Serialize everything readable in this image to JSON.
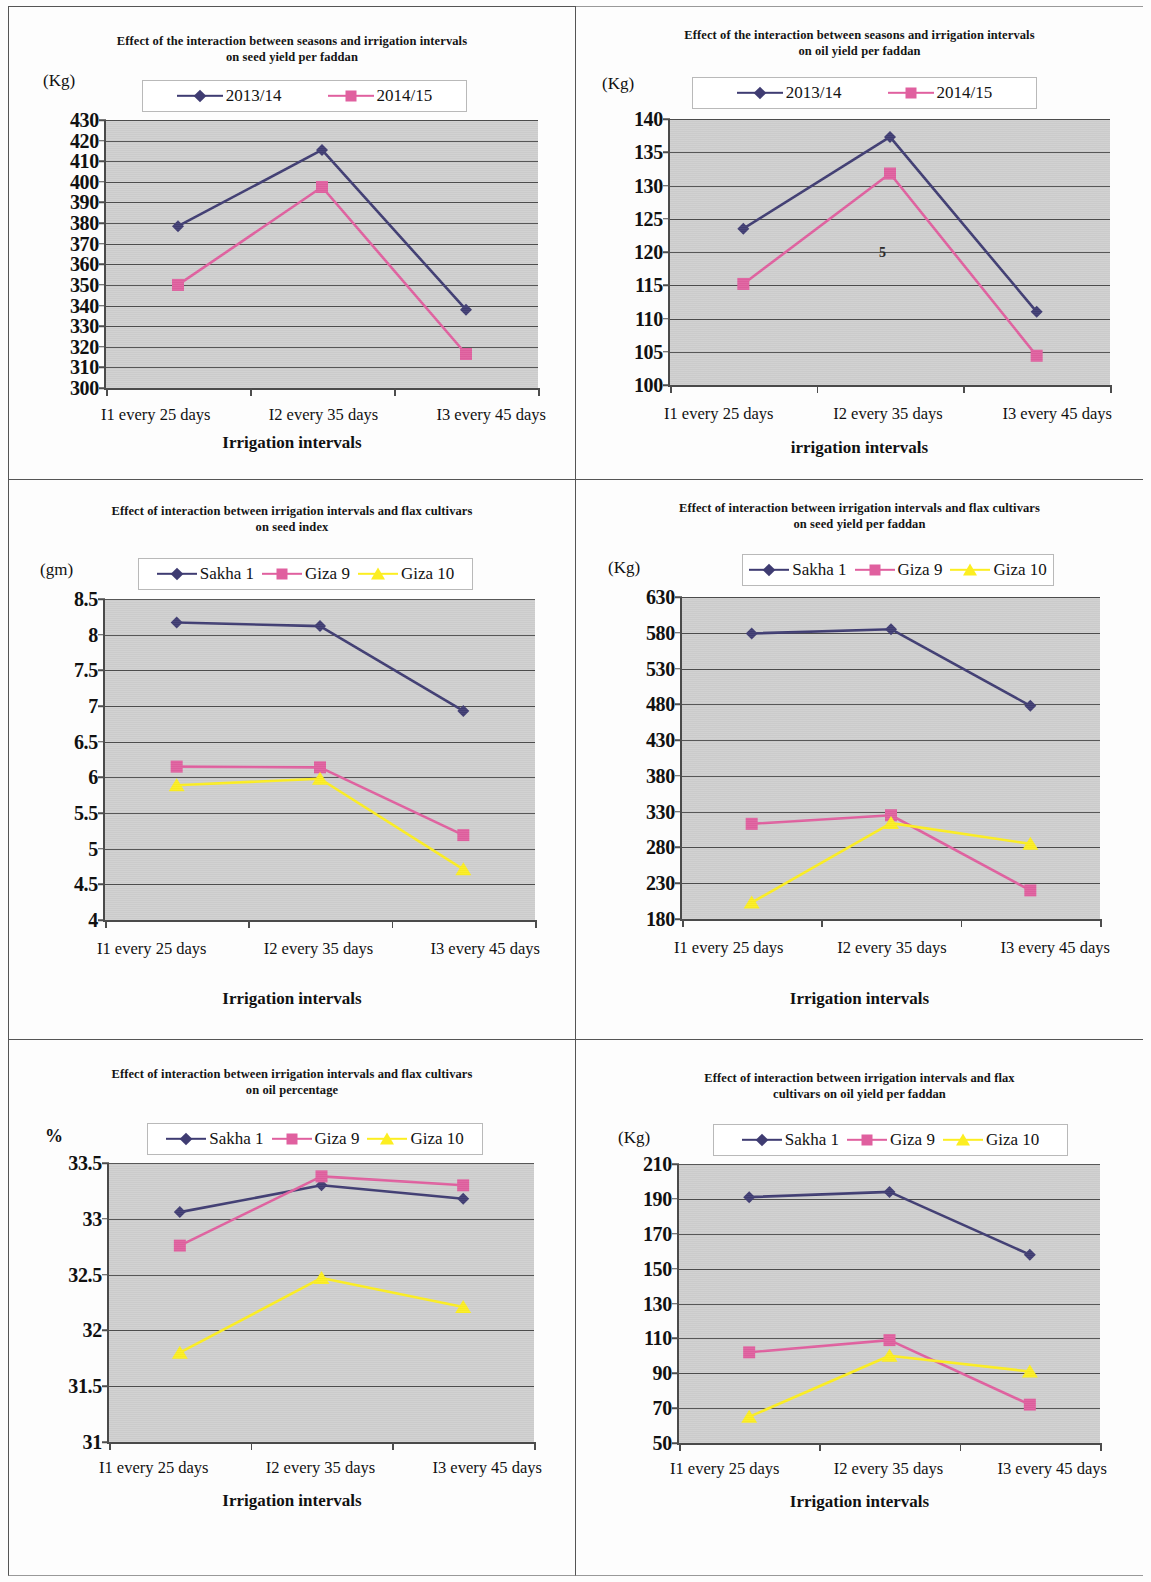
{
  "page": {
    "figure_count": 6,
    "layout": "2 columns x 3 rows of line charts"
  },
  "common": {
    "x_categories": [
      "I1 every 25 days",
      "I2 every 35 days",
      "I3 every 45 days"
    ],
    "colors": {
      "series_seasons_1": "#3f3c72",
      "series_seasons_2": "#e0609f",
      "sakha1": "#3f3c72",
      "giza9": "#e0609f",
      "giza10": "#fcee21",
      "plot_background": "#cfcfcf",
      "gridline": "#4d4d4d",
      "axis": "#4a4a4a",
      "text": "#111111"
    }
  },
  "charts": [
    {
      "id": "seed-yield-seasons",
      "position": "top-left",
      "title_line1": "Effect of the interaction between seasons and irrigation intervals",
      "title_line2": "on seed yield per faddan",
      "unit_label": "(Kg)",
      "xlabel": "Irrigation intervals",
      "ylabel": "(Kg)",
      "chart_data": {
        "type": "line",
        "title": "Effect of the interaction between seasons and irrigation intervals on seed yield per faddan",
        "xlabel": "Irrigation intervals",
        "ylabel": "(Kg)",
        "categories": [
          "I1 every 25 days",
          "I2 every 35 days",
          "I3 every 45 days"
        ],
        "series": [
          {
            "name": "2013/14",
            "color": "#3f3c72",
            "marker": "diamond",
            "values": [
              378.5,
              415.5,
              338.0
            ]
          },
          {
            "name": "2014/15",
            "color": "#e0609f",
            "marker": "square",
            "values": [
              350.0,
              397.5,
              316.5
            ]
          }
        ],
        "ylim": [
          300,
          430
        ],
        "ytick_step": 10,
        "yticks": [
          300,
          310,
          320,
          330,
          340,
          350,
          360,
          370,
          380,
          390,
          400,
          410,
          420,
          430
        ],
        "grid": true,
        "legend_position": "top-center",
        "legend_entries": [
          "2013/14",
          "2014/15"
        ]
      }
    },
    {
      "id": "oil-yield-seasons",
      "position": "top-right",
      "title_line1": "Effect of the interaction between seasons and irrigation intervals",
      "title_line2": "on oil yield per faddan",
      "unit_label": "(Kg)",
      "xlabel": "irrigation intervals",
      "ylabel": "(Kg)",
      "annotation": "5",
      "chart_data": {
        "type": "line",
        "title": "Effect of the interaction between seasons and irrigation intervals on oil yield per faddan",
        "xlabel": "irrigation intervals",
        "ylabel": "(Kg)",
        "categories": [
          "I1 every 25 days",
          "I2 every 35 days",
          "I3 every 45 days"
        ],
        "series": [
          {
            "name": "2013/14",
            "color": "#3f3c72",
            "marker": "diamond",
            "values": [
              123.5,
              137.3,
              111.0
            ]
          },
          {
            "name": "2014/15",
            "color": "#e0609f",
            "marker": "square",
            "values": [
              115.2,
              131.8,
              104.4
            ]
          }
        ],
        "ylim": [
          100,
          140
        ],
        "ytick_step": 5,
        "yticks": [
          100,
          105,
          110,
          115,
          120,
          125,
          130,
          135,
          140
        ],
        "grid": true,
        "legend_position": "top-center",
        "legend_entries": [
          "2013/14",
          "2014/15"
        ],
        "annotations": [
          {
            "text": "5",
            "x_value": 1.55,
            "y_value": 120.0
          }
        ]
      }
    },
    {
      "id": "seed-index-cultivars",
      "position": "middle-left",
      "title_line1": "Effect of interaction between irrigation intervals and flax cultivars",
      "title_line2": "on seed index",
      "unit_label": "(gm)",
      "xlabel": "Irrigation intervals",
      "ylabel": "(gm)",
      "chart_data": {
        "type": "line",
        "title": "Effect of interaction between irrigation intervals and flax cultivars on seed index",
        "xlabel": "Irrigation intervals",
        "ylabel": "(gm)",
        "categories": [
          "I1 every 25 days",
          "I2 every 35 days",
          "I3 every 45 days"
        ],
        "series": [
          {
            "name": "Sakha 1",
            "color": "#3f3c72",
            "marker": "diamond",
            "values": [
              8.17,
              8.12,
              6.93
            ]
          },
          {
            "name": "Giza  9",
            "color": "#e0609f",
            "marker": "square",
            "values": [
              6.15,
              6.14,
              5.19
            ]
          },
          {
            "name": "Giza 10",
            "color": "#fcee21",
            "marker": "triangle",
            "values": [
              5.89,
              5.98,
              4.71
            ]
          }
        ],
        "ylim": [
          4,
          8.5
        ],
        "ytick_step": 0.5,
        "yticks": [
          4,
          4.5,
          5,
          5.5,
          6,
          6.5,
          7,
          7.5,
          8,
          8.5
        ],
        "grid": true,
        "legend_position": "top-center",
        "legend_entries": [
          "Sakha 1",
          "Giza  9",
          "Giza 10"
        ]
      }
    },
    {
      "id": "seed-yield-cultivars",
      "position": "middle-right",
      "title_line1": "Effect of interaction between irrigation intervals and flax cultivars",
      "title_line2": "on seed yield per faddan",
      "unit_label": "(Kg)",
      "xlabel": "Irrigation intervals",
      "ylabel": "(Kg)",
      "chart_data": {
        "type": "line",
        "title": "Effect of interaction between irrigation intervals and flax cultivars on seed yield per faddan",
        "xlabel": "Irrigation intervals",
        "ylabel": "(Kg)",
        "categories": [
          "I1 every 25 days",
          "I2 every 35 days",
          "I3 every 45 days"
        ],
        "series": [
          {
            "name": "Sakha 1",
            "color": "#3f3c72",
            "marker": "diamond",
            "values": [
              579.0,
              585.0,
              478.0
            ]
          },
          {
            "name": "Giza  9",
            "color": "#e0609f",
            "marker": "square",
            "values": [
              313.0,
              325.0,
              220.0
            ]
          },
          {
            "name": "Giza 10",
            "color": "#fcee21",
            "marker": "triangle",
            "values": [
              203.0,
              314.0,
              285.0
            ]
          }
        ],
        "ylim": [
          180,
          630
        ],
        "ytick_step": 50,
        "yticks": [
          180,
          230,
          280,
          330,
          380,
          430,
          480,
          530,
          580,
          630
        ],
        "grid": true,
        "legend_position": "top-center",
        "legend_entries": [
          "Sakha 1",
          "Giza  9",
          "Giza 10"
        ]
      }
    },
    {
      "id": "oil-percentage-cultivars",
      "position": "bottom-left",
      "title_line1": "Effect of interaction between irrigation intervals and flax cultivars",
      "title_line2": "on oil percentage",
      "unit_label": "%",
      "xlabel": "Irrigation intervals",
      "ylabel": "%",
      "chart_data": {
        "type": "line",
        "title": "Effect of interaction between irrigation intervals and flax cultivars on oil percentage",
        "xlabel": "Irrigation intervals",
        "ylabel": "%",
        "categories": [
          "I1 every 25 days",
          "I2 every 35 days",
          "I3 every 45 days"
        ],
        "series": [
          {
            "name": "Sakha 1",
            "color": "#3f3c72",
            "marker": "diamond",
            "values": [
              33.06,
              33.3,
              33.18
            ]
          },
          {
            "name": "Giza  9",
            "color": "#e0609f",
            "marker": "square",
            "values": [
              32.76,
              33.38,
              33.3
            ]
          },
          {
            "name": "Giza 10",
            "color": "#fcee21",
            "marker": "triangle",
            "values": [
              31.8,
              32.47,
              32.21
            ]
          }
        ],
        "ylim": [
          31,
          33.5
        ],
        "ytick_step": 0.5,
        "yticks": [
          31,
          31.5,
          32,
          32.5,
          33,
          33.5
        ],
        "grid": true,
        "legend_position": "top-center",
        "legend_entries": [
          "Sakha 1",
          "Giza  9",
          "Giza 10"
        ]
      }
    },
    {
      "id": "oil-yield-cultivars",
      "position": "bottom-right",
      "title_line1": "Effect of interaction between irrigation intervals and flax",
      "title_line2": "cultivars on oil yield per faddan",
      "unit_label": "(Kg)",
      "xlabel": "Irrigation intervals",
      "ylabel": "(Kg)",
      "chart_data": {
        "type": "line",
        "title": "Effect of interaction between irrigation intervals and flax cultivars on oil yield per faddan",
        "xlabel": "Irrigation intervals",
        "ylabel": "(Kg)",
        "categories": [
          "I1 every 25 days",
          "I2 every 35 days",
          "I3 every 45 days"
        ],
        "series": [
          {
            "name": "Sakha 1",
            "color": "#3f3c72",
            "marker": "diamond",
            "values": [
              191.0,
              194.0,
              158.0
            ]
          },
          {
            "name": "Giza  9",
            "color": "#e0609f",
            "marker": "square",
            "values": [
              102.0,
              109.0,
              72.0
            ]
          },
          {
            "name": "Giza 10",
            "color": "#fcee21",
            "marker": "triangle",
            "values": [
              65.0,
              100.0,
              91.0
            ]
          }
        ],
        "ylim": [
          50,
          210
        ],
        "ytick_step": 20,
        "yticks": [
          50,
          70,
          90,
          110,
          130,
          150,
          170,
          190,
          210
        ],
        "grid": true,
        "legend_position": "top-center",
        "legend_entries": [
          "Sakha 1",
          "Giza  9",
          "Giza 10"
        ]
      }
    }
  ]
}
